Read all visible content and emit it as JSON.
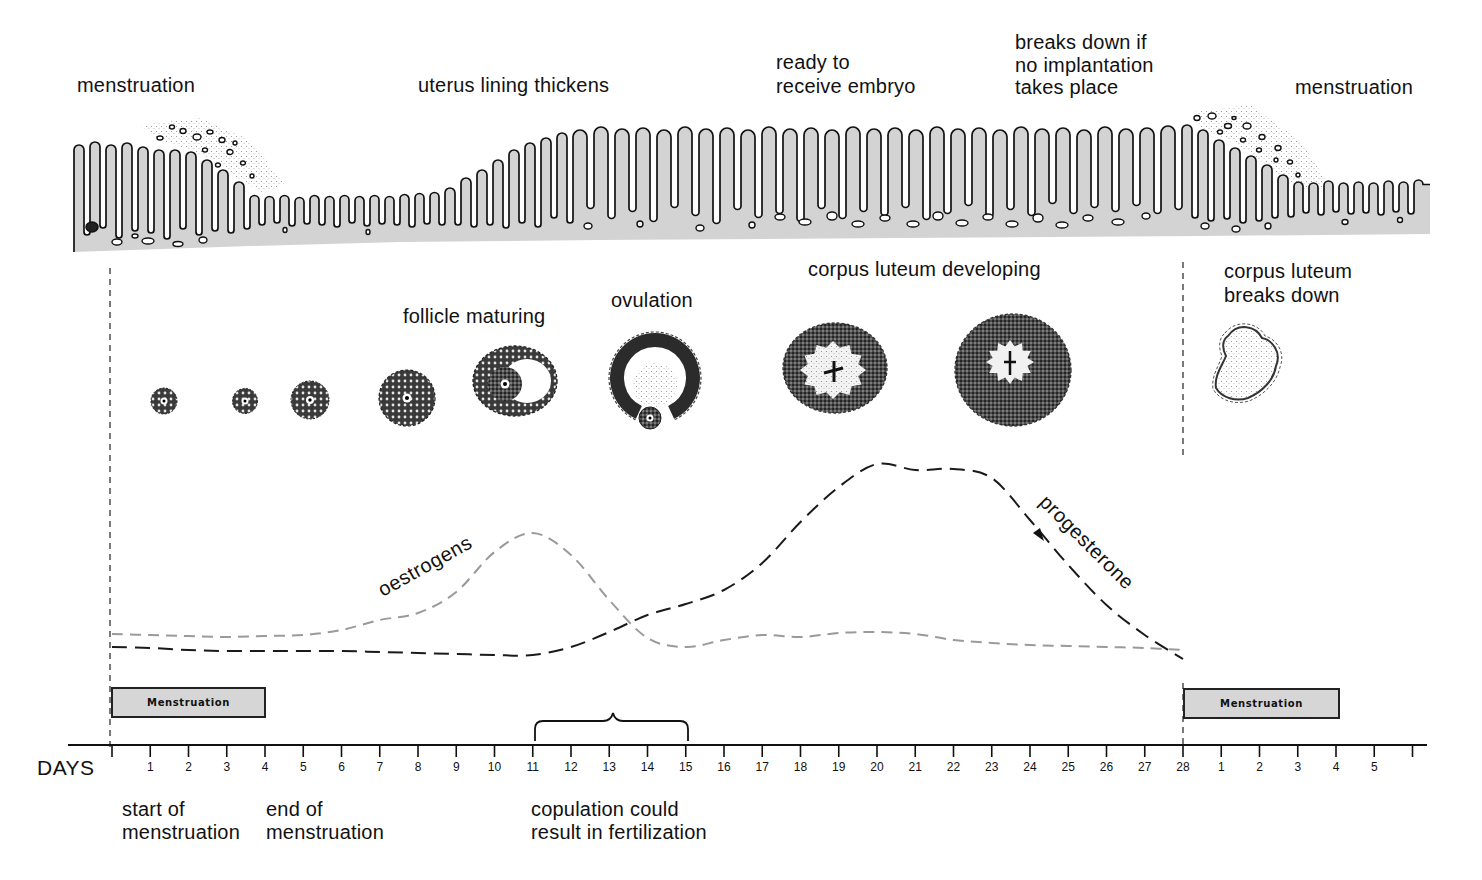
{
  "colors": {
    "endometrium": "#d3d3d3",
    "oestrogen": "#9a9a9a",
    "progesterone": "#1a1a1a",
    "menstruation_bar": "#d6d6d6",
    "ink": "#111111"
  },
  "endometrium": {
    "menstruation_left": "menstruation",
    "lining_thickens": "uterus lining thickens",
    "ready": {
      "line1": "ready to",
      "line2": "receive embryo"
    },
    "breaks_down": {
      "line1": "breaks down if",
      "line2": "no implantation",
      "line3": "takes place"
    },
    "menstruation_right": "menstruation"
  },
  "ovary": {
    "follicle_maturing": "follicle maturing",
    "ovulation": "ovulation",
    "corpus_luteum_developing": "corpus luteum developing",
    "corpus_luteum_breaks_down": {
      "line1": "corpus luteum",
      "line2": "breaks down"
    }
  },
  "hormones": {
    "oestrogen": {
      "label": "oestrogens",
      "levels": [
        13,
        12.5,
        12,
        11.5,
        12,
        12.5,
        15,
        20,
        23.5,
        34,
        54,
        63.5,
        52.5,
        30,
        11,
        6.5,
        10,
        12.5,
        11.5,
        13.5,
        14,
        13,
        10,
        8.5,
        7.5,
        7,
        6.5,
        6,
        5
      ]
    },
    "progesterone": {
      "label": "progesterone",
      "levels": [
        6.5,
        6,
        5,
        4.5,
        4.5,
        4.5,
        4.5,
        4,
        3.5,
        3,
        2.5,
        2.5,
        6.5,
        14,
        22.5,
        28,
        35,
        48.5,
        69,
        86.5,
        98,
        95,
        95.5,
        91,
        70,
        47.5,
        27.5,
        12.5,
        0.5
      ]
    }
  },
  "timeline": {
    "axis_label": "DAYS",
    "ticks": [
      "",
      "1",
      "2",
      "3",
      "4",
      "5",
      "6",
      "7",
      "8",
      "9",
      "10",
      "11",
      "12",
      "13",
      "14",
      "15",
      "16",
      "17",
      "18",
      "19",
      "20",
      "21",
      "22",
      "23",
      "24",
      "25",
      "26",
      "27",
      "28",
      "1",
      "2",
      "3",
      "4",
      "5",
      ""
    ],
    "menstruation_bars": [
      {
        "label": "Menstruation",
        "start_day": 0,
        "end_day": 4
      },
      {
        "label": "Menstruation",
        "start_day": 28,
        "end_day": 32
      }
    ],
    "fertile_window": {
      "start_day": 11,
      "end_day": 15
    }
  },
  "annotations": {
    "start": {
      "line1": "start of",
      "line2": "menstruation"
    },
    "end": {
      "line1": "end of",
      "line2": "menstruation"
    },
    "copulation": {
      "line1": "copulation could",
      "line2": "result in fertilization"
    }
  }
}
